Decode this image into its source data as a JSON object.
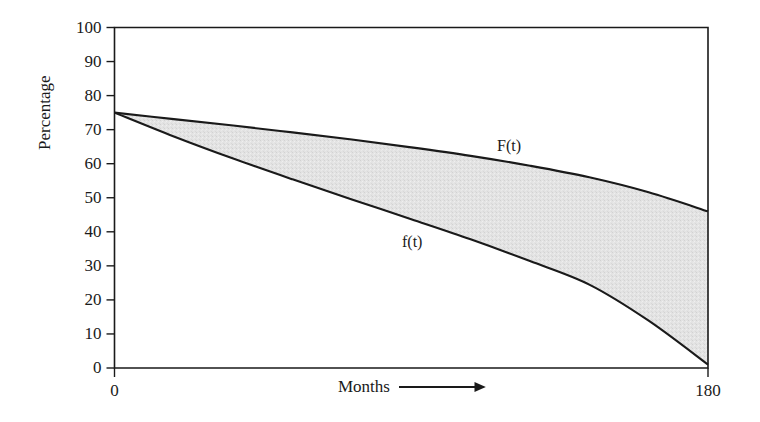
{
  "chart_data": {
    "type": "area",
    "title": "",
    "subtitle": "",
    "xlabel": "Months",
    "ylabel": "Percentage",
    "xlim": [
      0,
      180
    ],
    "ylim": [
      0,
      100
    ],
    "xticks": [
      0,
      180
    ],
    "xtick_labels": [
      "0",
      "180"
    ],
    "yticks": [
      0,
      10,
      20,
      30,
      40,
      50,
      60,
      70,
      80,
      90,
      100
    ],
    "ytick_labels": [
      "0",
      "10",
      "20",
      "30",
      "40",
      "50",
      "60",
      "70",
      "80",
      "90",
      "100"
    ],
    "grid": false,
    "legend": "inline-annotations",
    "fill_between": {
      "upper_series": "F(t)",
      "lower_series": "f(t)",
      "fill_color": "#e2e2e2",
      "edge_color": "#1a1a1a"
    },
    "x": [
      0,
      18,
      36,
      54,
      72,
      90,
      108,
      126,
      144,
      162,
      180
    ],
    "series": [
      {
        "name": "F(t)",
        "label": "F(t)",
        "color": "#1a1a1a",
        "values": [
          75.0,
          73.1,
          71.2,
          69.2,
          67.1,
          64.8,
          62.3,
          59.4,
          56.0,
          51.6,
          46.0
        ]
      },
      {
        "name": "f(t)",
        "label": "f(t)",
        "color": "#1a1a1a",
        "values": [
          75.0,
          68.0,
          61.5,
          55.4,
          49.5,
          43.7,
          37.8,
          31.4,
          24.5,
          13.9,
          1.0
        ]
      }
    ],
    "annotations": [
      {
        "text": "F(t)",
        "x": 116,
        "y": 67
      },
      {
        "text": "f(t)",
        "x": 87,
        "y": 40
      }
    ]
  },
  "axes": {
    "y_label": "Percentage",
    "x_label": "Months",
    "x_arrow": "right-arrow",
    "y_ticks": [
      {
        "value": 100,
        "label": "100"
      },
      {
        "value": 90,
        "label": "90"
      },
      {
        "value": 80,
        "label": "80"
      },
      {
        "value": 70,
        "label": "70"
      },
      {
        "value": 60,
        "label": "60"
      },
      {
        "value": 50,
        "label": "50"
      },
      {
        "value": 40,
        "label": "40"
      },
      {
        "value": 30,
        "label": "30"
      },
      {
        "value": 20,
        "label": "20"
      },
      {
        "value": 10,
        "label": "10"
      },
      {
        "value": 0,
        "label": "0"
      }
    ],
    "x_ticks": [
      {
        "value": 0,
        "label": "0"
      },
      {
        "value": 180,
        "label": "180"
      }
    ]
  },
  "curve_labels": {
    "upper": "F(t)",
    "lower": "f(t)"
  },
  "colors": {
    "background": "#ffffff",
    "axis": "#1a1a1a",
    "curve": "#1a1a1a",
    "fill": "#e2e2e2",
    "text": "#1a1a1a"
  }
}
